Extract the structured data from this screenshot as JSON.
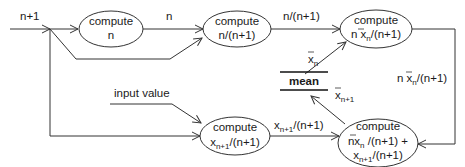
{
  "diagram": {
    "type": "dataflow",
    "nodes": {
      "compute_n": {
        "line1": "compute",
        "line2": "n"
      },
      "compute_ratio": {
        "line1": "compute",
        "line2": "n/(n+1)"
      },
      "compute_nxn": {
        "line1": "compute",
        "line2_pre": "n x",
        "line2_sub": "n",
        "line2_post": "/(n+1)"
      },
      "compute_xnext": {
        "line1": "compute",
        "line2_main": "x",
        "line2_sub": "n+1",
        "line2_post": "/(n+1)"
      },
      "compute_sum": {
        "line1": "compute",
        "line2_pre": "nx",
        "line2_sub": "n",
        "line2_post": " /(n+1) +",
        "line3_main": "x",
        "line3_sub": "n+1",
        "line3_post": "/(n+1)"
      },
      "mean": {
        "label": "mean"
      }
    },
    "edge_labels": {
      "input_n_plus_1": "n+1",
      "n": "n",
      "ratio": "n/(n+1)",
      "xbar_n_main": "x",
      "xbar_n_sub": "n",
      "xbar_n1_main": "x",
      "xbar_n1_sub": "n+1",
      "nxn_pre": "n x",
      "nxn_sub": "n",
      "nxn_post": "/(n+1)",
      "input_value": "input value",
      "xnext_main": "x",
      "xnext_sub": "n+1",
      "xnext_post": "/(n+1)"
    }
  }
}
